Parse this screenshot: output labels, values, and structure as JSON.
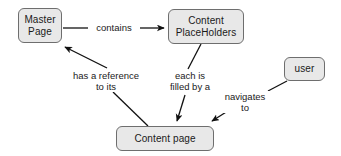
{
  "diagram": {
    "type": "concept-map",
    "nodes": [
      {
        "id": "master-page",
        "label": "Master\nPage"
      },
      {
        "id": "content-placeholders",
        "label": "Content\nPlaceHolders"
      },
      {
        "id": "user",
        "label": "user"
      },
      {
        "id": "content-page",
        "label": "Content page"
      }
    ],
    "edges": [
      {
        "id": "contains",
        "from": "master-page",
        "to": "content-placeholders",
        "label": "contains"
      },
      {
        "id": "has-reference",
        "from": "content-page",
        "to": "master-page",
        "label": "has a reference\nto its"
      },
      {
        "id": "each-filled",
        "from": "content-placeholders",
        "to": "content-page",
        "label": "each is\nfilled by a"
      },
      {
        "id": "navigates",
        "from": "user",
        "to": "content-page",
        "label": "navigates\nto"
      }
    ],
    "colors": {
      "node_fill": "#e8e8e8",
      "node_border": "#6e6e6e",
      "edge_stroke": "#111111",
      "text": "#1a1a1a",
      "background": "#ffffff"
    }
  }
}
